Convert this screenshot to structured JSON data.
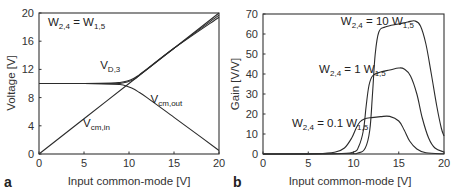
{
  "chart_data": [
    {
      "panel": "a",
      "type": "line",
      "title": "",
      "xlabel": "Input common-mode [V]",
      "ylabel": "Voltage [V]",
      "xlim": [
        0,
        20
      ],
      "ylim": [
        0,
        20
      ],
      "xticks": [
        0,
        5,
        10,
        15,
        20
      ],
      "yticks": [
        0,
        4,
        8,
        12,
        16,
        20
      ],
      "grid": false,
      "legend": "none",
      "annotations": [
        {
          "text": "W",
          "sub": "2,4",
          "suffix": " = W",
          "sub2": "1,5",
          "x": 1.0,
          "y": 18.2
        },
        {
          "text": "V",
          "sub": "D,3",
          "x": 6.8,
          "y": 12.0
        },
        {
          "text": "V",
          "sub": "cm,out",
          "x": 12.4,
          "y": 7.2
        },
        {
          "text": "V",
          "sub": "cm,in",
          "x": 4.9,
          "y": 3.8
        }
      ],
      "series": [
        {
          "name": "V_cm,in",
          "x": [
            0,
            5,
            10,
            15,
            20
          ],
          "y": [
            0,
            5,
            10,
            15,
            20
          ]
        },
        {
          "name": "V_D,3",
          "x": [
            0,
            5,
            8,
            9,
            9.8,
            10.5,
            11,
            12,
            15,
            20
          ],
          "y": [
            10,
            10,
            10.05,
            10.15,
            10.35,
            10.7,
            11.1,
            12.05,
            15,
            19.4
          ]
        },
        {
          "name": "V_D,3 (alt)",
          "x": [
            0,
            5,
            8,
            9,
            9.8,
            10.5,
            11,
            12,
            15,
            20
          ],
          "y": [
            10,
            10,
            9.95,
            10.0,
            10.2,
            10.55,
            11.0,
            12.0,
            15,
            19.7
          ]
        },
        {
          "name": "V_cm,out",
          "x": [
            0,
            5,
            8,
            9,
            9.7,
            10.3,
            11,
            12,
            15,
            18,
            20
          ],
          "y": [
            10,
            10,
            9.95,
            9.85,
            9.65,
            9.35,
            8.85,
            8.0,
            5.2,
            2.4,
            0.5
          ]
        }
      ]
    },
    {
      "panel": "b",
      "type": "line",
      "title": "",
      "xlabel": "Input common-mode [V]",
      "ylabel": "Gain [V/V]",
      "xlim": [
        0,
        20
      ],
      "ylim": [
        0,
        70
      ],
      "xticks": [
        0,
        5,
        10,
        15,
        20
      ],
      "yticks": [
        0,
        10,
        20,
        30,
        40,
        50,
        60,
        70
      ],
      "grid": false,
      "legend": "none",
      "annotations": [
        {
          "text": "W",
          "sub": "2,4",
          "suffix": " = 10 W",
          "sub2": "1,5",
          "x": 8.6,
          "y": 64.5
        },
        {
          "text": "W",
          "sub": "2,4",
          "suffix": " = 1 W",
          "sub2": "1,5",
          "x": 6.2,
          "y": 40.5
        },
        {
          "text": "W",
          "sub": "2,4",
          "suffix": " = 0.1 W",
          "sub2": "1,5",
          "x": 3.2,
          "y": 13.5
        }
      ],
      "series": [
        {
          "name": "W2,4 = 0.1 W1,5",
          "x": [
            0,
            6,
            8,
            9,
            9.8,
            10.3,
            10.7,
            11.2,
            12,
            13,
            14,
            15,
            15.6,
            16.2,
            17,
            18,
            20
          ],
          "y": [
            0,
            0.2,
            1,
            3,
            8,
            13,
            16,
            17.5,
            18.2,
            18.7,
            18.8,
            16.5,
            12,
            6.5,
            2.5,
            0.6,
            0.1
          ]
        },
        {
          "name": "W2,4 = 1 W1,5",
          "x": [
            0,
            8,
            10,
            10.6,
            11.1,
            11.4,
            11.7,
            12.1,
            13,
            14,
            15,
            15.6,
            16.3,
            17,
            17.6,
            18.3,
            19,
            20
          ],
          "y": [
            0,
            0.1,
            1,
            4,
            12,
            24,
            34,
            39,
            41,
            42,
            43,
            42.5,
            39,
            30,
            18,
            8,
            3,
            1
          ]
        },
        {
          "name": "W2,4 = 10 W1,5",
          "x": [
            0,
            9,
            10.5,
            11.3,
            11.8,
            12.1,
            12.4,
            12.8,
            13.5,
            15,
            16,
            16.8,
            17.4,
            18,
            18.6,
            19.2,
            19.7,
            20
          ],
          "y": [
            0,
            0.1,
            0.5,
            3,
            12,
            30,
            50,
            61,
            63.5,
            65,
            66,
            66.5,
            64,
            55,
            40,
            24,
            13,
            9
          ]
        }
      ]
    }
  ],
  "panels": {
    "a": {
      "label": "a",
      "xlabel": "Input common-mode [V]",
      "ylabel": "Voltage [V]"
    },
    "b": {
      "label": "b",
      "xlabel": "Input common-mode [V]",
      "ylabel": "Gain [V/V]"
    }
  }
}
